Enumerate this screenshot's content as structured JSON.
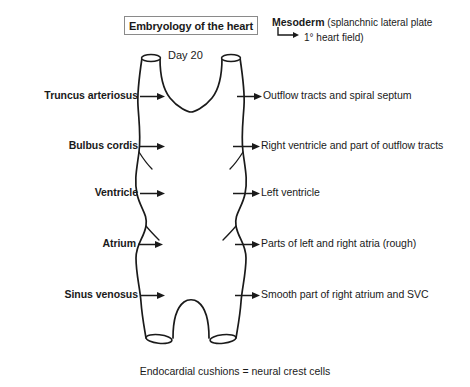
{
  "title": {
    "text": "Embryology of the heart"
  },
  "mesoderm_note": {
    "term": "Mesoderm",
    "detail": "(splanchnic lateral plate",
    "sub_detail": "1°  heart field)",
    "elbow_icon": "elbow-arrow-icon"
  },
  "diagram": {
    "day_label": "Day 20",
    "stroke_color": "#1a1a1a",
    "fill_color": "#ffffff"
  },
  "rows": [
    {
      "left_label": "Truncus  arteriosus",
      "right_label": "Outflow tracts and spiral septum",
      "y": 97,
      "left_arrow_end": 150,
      "right_arrow_start": 237,
      "name": "truncus-arteriosus"
    },
    {
      "left_label": "Bulbus cordis",
      "right_label": "Right ventricle and part of outflow tracts",
      "y": 147,
      "left_arrow_end": 150,
      "right_arrow_start": 233,
      "name": "bulbus-cordis"
    },
    {
      "left_label": "Ventricle",
      "right_label": "Left ventricle",
      "y": 194,
      "left_arrow_end": 150,
      "right_arrow_start": 233,
      "name": "ventricle"
    },
    {
      "left_label": "Atrium",
      "right_label": "Parts of left and right atria (rough)",
      "y": 245,
      "left_arrow_end": 148,
      "right_arrow_start": 235,
      "name": "atrium"
    },
    {
      "left_label": "Sinus venosus",
      "right_label": "Smooth part of right atrium and SVC",
      "y": 296,
      "left_arrow_end": 150,
      "right_arrow_start": 235,
      "name": "sinus-venosus"
    }
  ],
  "caption": {
    "text": "Endocardial cushions = neural crest cells"
  }
}
